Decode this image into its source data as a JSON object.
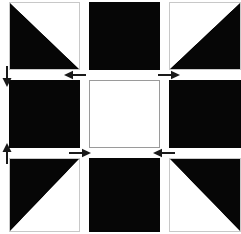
{
  "diagram": {
    "name": "quilt-block-pressing-diagram",
    "width": 241,
    "height": 234,
    "colors": {
      "dark_fabric": "#060606",
      "light_fabric": "#ffffff",
      "patch_outline": "#9a9a9a",
      "arrow": "#1a1a1a",
      "background": "#ffffff"
    },
    "grid": {
      "rows": 3,
      "columns": 3,
      "column_edges_px": [
        9,
        80,
        89,
        160,
        169,
        241
      ],
      "row_edges_px": [
        2,
        70,
        80,
        148,
        158,
        232
      ]
    },
    "patches": [
      {
        "id": "patch-top-left",
        "row": 1,
        "col": 1,
        "type": "half-square-triangle",
        "dark_corner": "top-left",
        "label": "Half-square triangle, dark upper-left"
      },
      {
        "id": "patch-top-center",
        "row": 1,
        "col": 2,
        "type": "solid",
        "fill": "dark",
        "label": "Solid dark square"
      },
      {
        "id": "patch-top-right",
        "row": 1,
        "col": 3,
        "type": "half-square-triangle",
        "dark_corner": "top-right",
        "label": "Half-square triangle, dark upper-right"
      },
      {
        "id": "patch-middle-left",
        "row": 2,
        "col": 1,
        "type": "solid",
        "fill": "dark",
        "label": "Solid dark square"
      },
      {
        "id": "patch-center",
        "row": 2,
        "col": 2,
        "type": "solid",
        "fill": "light",
        "label": "Solid light center square"
      },
      {
        "id": "patch-middle-right",
        "row": 2,
        "col": 3,
        "type": "solid",
        "fill": "dark",
        "label": "Solid dark square"
      },
      {
        "id": "patch-bottom-left",
        "row": 3,
        "col": 1,
        "type": "half-square-triangle",
        "dark_corner": "bottom-left",
        "label": "Half-square triangle, dark lower-left"
      },
      {
        "id": "patch-bottom-center",
        "row": 3,
        "col": 2,
        "type": "solid",
        "fill": "dark",
        "label": "Solid dark square"
      },
      {
        "id": "patch-bottom-right",
        "row": 3,
        "col": 3,
        "type": "half-square-triangle",
        "dark_corner": "bottom-right",
        "label": "Half-square triangle, dark lower-right"
      }
    ],
    "arrows": [
      {
        "id": "arrow-left-upper-seam",
        "direction": "down",
        "x": 1,
        "y": 66,
        "length": 20,
        "label": "Press down"
      },
      {
        "id": "arrow-left-lower-seam",
        "direction": "up",
        "x": 1,
        "y": 142,
        "length": 20,
        "label": "Press up"
      },
      {
        "id": "arrow-upper-seam-left",
        "direction": "left",
        "x": 63,
        "y": 70,
        "length": 22,
        "label": "Press left"
      },
      {
        "id": "arrow-upper-seam-right",
        "direction": "right",
        "x": 157,
        "y": 70,
        "length": 22,
        "label": "Press right"
      },
      {
        "id": "arrow-lower-seam-right",
        "direction": "right",
        "x": 68,
        "y": 148,
        "length": 22,
        "label": "Press right"
      },
      {
        "id": "arrow-lower-seam-left",
        "direction": "left",
        "x": 152,
        "y": 148,
        "length": 22,
        "label": "Press left"
      }
    ]
  }
}
